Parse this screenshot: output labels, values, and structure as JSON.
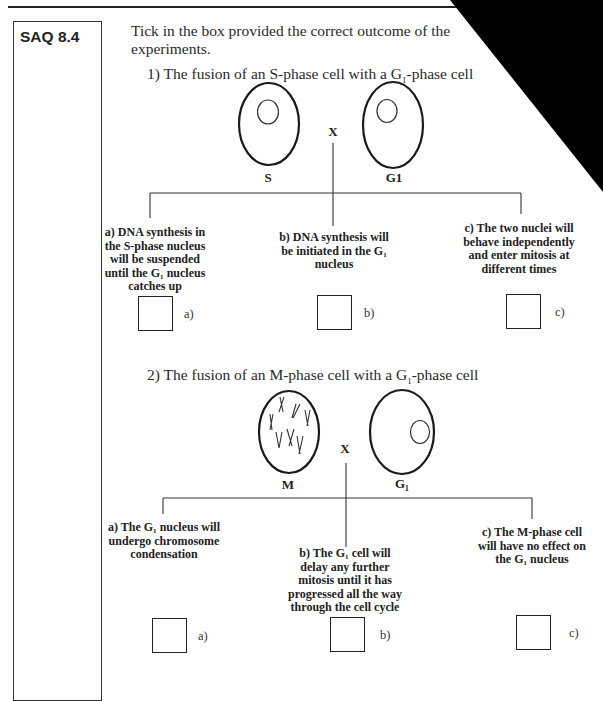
{
  "saq": {
    "label": "SAQ 8.4",
    "instruction": "Tick in the box provided the correct outcome of the",
    "instruction_line2": "experiments."
  },
  "questions": [
    {
      "number": "1)",
      "title_pre": "1) The fusion of an S-phase cell with a G",
      "title_sub": "1",
      "title_post": "-phase cell",
      "cells": [
        {
          "label": "S",
          "type": "S-phase"
        },
        {
          "label": "G1",
          "type": "G1-phase"
        }
      ],
      "fusion_mark": "X",
      "options": [
        {
          "key": "a)",
          "text_lines": [
            "a) DNA synthesis in",
            "the S-phase nucleus",
            "will be suspended",
            "until the G₁ nucleus",
            "catches up"
          ],
          "checked": false
        },
        {
          "key": "b)",
          "text_lines": [
            "b) DNA synthesis will",
            "be initiated in the G₁",
            "nucleus"
          ],
          "checked": false
        },
        {
          "key": "c)",
          "text_lines": [
            "c) The two nuclei will",
            "behave independently",
            "and enter mitosis at",
            "different times"
          ],
          "checked": false
        }
      ]
    },
    {
      "number": "2)",
      "title_pre": "2) The fusion of an M-phase cell with a G",
      "title_sub": "1",
      "title_post": "-phase cell",
      "cells": [
        {
          "label": "M",
          "type": "M-phase"
        },
        {
          "label": "G₁",
          "type": "G1-phase"
        }
      ],
      "fusion_mark": "X",
      "options": [
        {
          "key": "a)",
          "text_lines": [
            "a) The G₁ nucleus will",
            "undergo chromosome",
            "condensation"
          ],
          "checked": false
        },
        {
          "key": "b)",
          "text_lines": [
            "b) The G₁ cell will",
            "delay any further",
            "mitosis until it has",
            "progressed all the way",
            "through the cell cycle"
          ],
          "checked": false
        },
        {
          "key": "c)",
          "text_lines": [
            "c) The M-phase cell",
            "will have no effect on",
            "the G₁ nucleus"
          ],
          "checked": false
        }
      ]
    }
  ],
  "colors": {
    "ink": "#222222",
    "paper": "#ffffff",
    "corner_fold": "#000000"
  }
}
